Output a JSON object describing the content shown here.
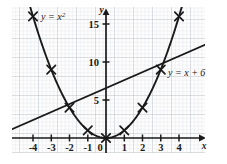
{
  "chart_data": {
    "type": "line",
    "title": "",
    "xlabel": "x",
    "ylabel": "y",
    "xlim": [
      -4.9,
      5.2
    ],
    "ylim": [
      -1.4,
      18.2
    ],
    "xticks": [
      -4,
      -3,
      -2,
      -1,
      0,
      1,
      2,
      3,
      4
    ],
    "xtick_labels": [
      "-4",
      "-3",
      "-2",
      "-1",
      "0",
      "1",
      "2",
      "3",
      "4"
    ],
    "yticks": [
      5,
      10,
      15
    ],
    "ytick_labels": [
      "5",
      "10",
      "15"
    ],
    "grid": true,
    "grid_minor": true,
    "grid_color": "#c9cdd4",
    "axis_color": "#1a1a1a",
    "curve_color": "#1a1a1a",
    "legend_position": "inline-annotations",
    "series": [
      {
        "name": "y = x^2",
        "label": "y = x",
        "label_exponent": "2",
        "label_x": -3.05,
        "label_y": 16.4,
        "type": "parabola",
        "marker": "x",
        "x": [
          -4,
          -3,
          -2,
          -1,
          0,
          1,
          2,
          3,
          4
        ],
        "values": [
          16,
          9,
          4,
          1,
          0,
          1,
          4,
          9,
          16
        ]
      },
      {
        "name": "y = x + 6",
        "label": "y = x + 6",
        "label_x": 3.35,
        "label_y": 8.6,
        "type": "line",
        "marker": "none",
        "x": [
          -4.85,
          5.15
        ],
        "values": [
          1.15,
          11.15
        ]
      }
    ],
    "intersections": [
      {
        "x": -2,
        "y": 4
      },
      {
        "x": 3,
        "y": 9
      }
    ],
    "annotations": [
      {
        "text": "y = x",
        "superscript": "2",
        "x": -3.05,
        "y": 16.4
      },
      {
        "text": "y = x + 6",
        "superscript": "",
        "x": 3.35,
        "y": 8.6
      }
    ]
  },
  "axes": {
    "x_axis_name": "x",
    "y_axis_name": "y",
    "origin_label": "0"
  }
}
